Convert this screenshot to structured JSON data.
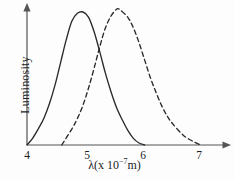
{
  "figure": {
    "background_color": "#fdfdfd",
    "curve_color": "#2a2a2a",
    "axis_color": "#545454"
  },
  "axes": {
    "ylabel": "Luminosity",
    "xlabel_lambda": "λ(x 10",
    "xlabel_exponent": "−7",
    "xlabel_tail": "m)",
    "xticks": [
      "4",
      "5",
      "6",
      "7"
    ]
  },
  "chart_data": {
    "type": "line",
    "title": "",
    "xlabel": "λ (x 10^-7 m)",
    "ylabel": "Luminosity",
    "xlim": [
      3.85,
      7.4
    ],
    "ylim": [
      0,
      1.08
    ],
    "grid": false,
    "legend": "none",
    "xticks": [
      4,
      5,
      6,
      7
    ],
    "xticklabels": [
      "4",
      "5",
      "6",
      "7"
    ],
    "yticks": [],
    "yticklabels": [],
    "series": [
      {
        "name": "solid-curve",
        "style": "solid",
        "color": "#2a2a2a",
        "peak_x": 5.0,
        "peak_y": 1.0,
        "x": [
          4.0,
          4.1,
          4.2,
          4.3,
          4.4,
          4.5,
          4.6,
          4.7,
          4.8,
          4.9,
          5.0,
          5.1,
          5.2,
          5.3,
          5.4,
          5.5,
          5.6,
          5.7,
          5.8,
          5.9,
          6.0,
          6.1
        ],
        "values": [
          0.0,
          0.05,
          0.12,
          0.2,
          0.31,
          0.45,
          0.62,
          0.79,
          0.93,
          0.99,
          1.0,
          0.96,
          0.85,
          0.7,
          0.54,
          0.4,
          0.28,
          0.19,
          0.11,
          0.05,
          0.015,
          0.0
        ]
      },
      {
        "name": "dashed-curve",
        "style": "dashed",
        "color": "#2a2a2a",
        "peak_x": 5.65,
        "peak_y": 1.02,
        "x": [
          4.62,
          4.8,
          4.9,
          5.0,
          5.1,
          5.2,
          5.3,
          5.4,
          5.5,
          5.6,
          5.65,
          5.8,
          5.9,
          6.0,
          6.1,
          6.2,
          6.3,
          6.4,
          6.5,
          6.6,
          6.8,
          7.0,
          7.1
        ],
        "values": [
          0.0,
          0.12,
          0.2,
          0.3,
          0.43,
          0.58,
          0.74,
          0.88,
          0.97,
          1.02,
          1.02,
          0.96,
          0.88,
          0.77,
          0.64,
          0.51,
          0.4,
          0.3,
          0.22,
          0.16,
          0.07,
          0.02,
          0.0
        ]
      }
    ]
  }
}
